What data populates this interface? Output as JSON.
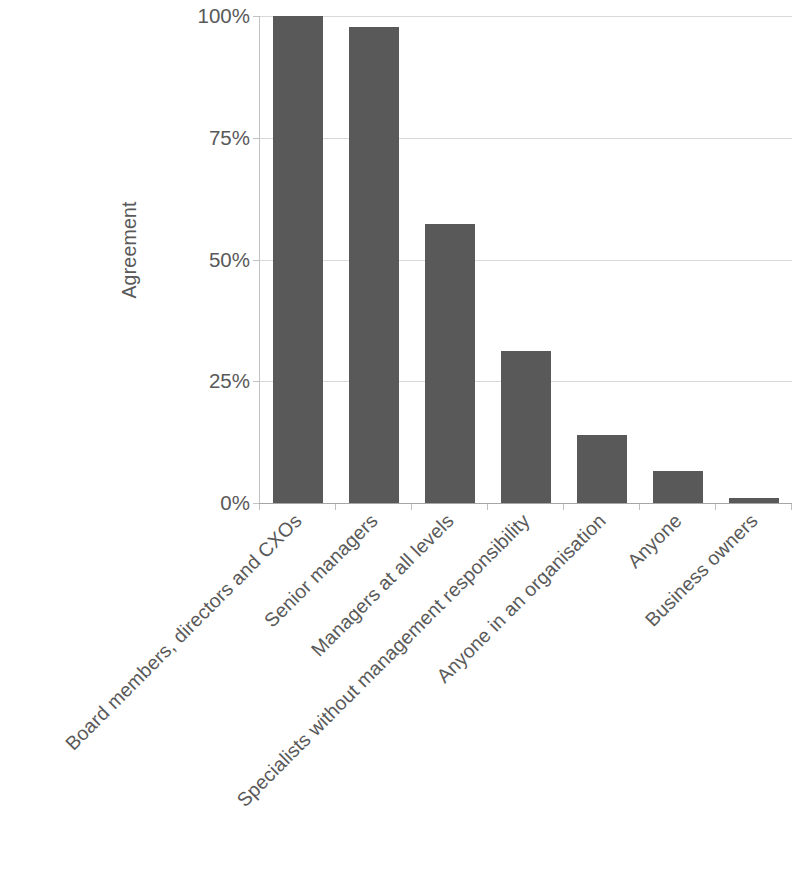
{
  "chart_data": {
    "type": "bar",
    "title": "",
    "xlabel": "",
    "ylabel": "Agreement",
    "ylim": [
      0,
      100
    ],
    "y_tick_labels": [
      "100%",
      "75%",
      "50%",
      "25%",
      "0%"
    ],
    "y_tick_values": [
      100,
      75,
      50,
      25,
      0
    ],
    "grid": true,
    "legend": "none",
    "bar_color": "#595959",
    "gridline_color": "#d9d9d9",
    "text_color": "#595959",
    "categories": [
      "Board members, directors and CXOs",
      "Senior managers",
      "Managers at all levels",
      "Specialists without management responsibility",
      "Anyone in an organisation",
      "Anyone",
      "Business owners"
    ],
    "values": [
      100,
      97.7,
      57.3,
      31.2,
      14.0,
      6.6,
      1.0
    ]
  }
}
